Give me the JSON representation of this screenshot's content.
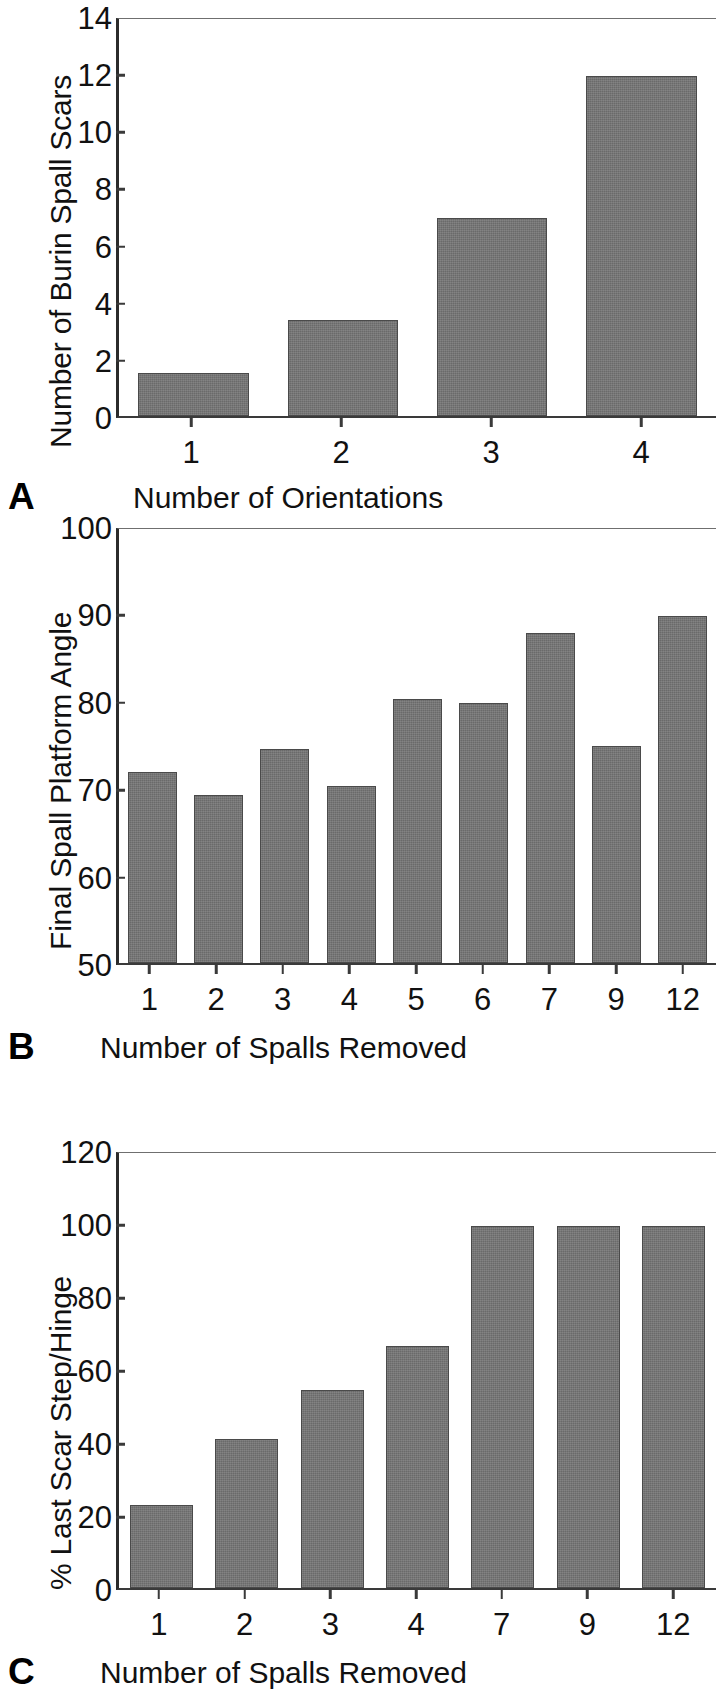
{
  "figure": {
    "background": "#ffffff",
    "bar_color": "#757575",
    "bar_edge_color": "#4a4a4a",
    "axis_color": "#3a3a3a"
  },
  "panels": [
    {
      "label": "A",
      "ylabel": "Number of Burin Spall Scars",
      "xlabel": "Number of Orientations",
      "yticks": [
        "14",
        "12",
        "10",
        "8",
        "6",
        "4",
        "2",
        "0"
      ],
      "xticks": [
        "1",
        "2",
        "3",
        "4"
      ]
    },
    {
      "label": "B",
      "ylabel": "Final Spall Platform Angle",
      "xlabel": "Number of Spalls Removed",
      "yticks": [
        "100",
        "90",
        "80",
        "70",
        "60",
        "50"
      ],
      "xticks": [
        "1",
        "2",
        "3",
        "4",
        "5",
        "6",
        "7",
        "9",
        "12"
      ]
    },
    {
      "label": "C",
      "ylabel": "% Last Scar Step/Hinge",
      "xlabel": "Number of Spalls Removed",
      "yticks": [
        "120",
        "100",
        "80",
        "60",
        "40",
        "20",
        "0"
      ],
      "xticks": [
        "1",
        "2",
        "3",
        "4",
        "7",
        "9",
        "12"
      ]
    }
  ],
  "chart_data": [
    {
      "type": "bar",
      "panel": "A",
      "title": "",
      "xlabel": "Number of Orientations",
      "ylabel": "Number of Burin Spall Scars",
      "categories": [
        "1",
        "2",
        "3",
        "4"
      ],
      "values": [
        1.5,
        3.4,
        7.0,
        12.0
      ],
      "ylim": [
        0,
        14
      ],
      "ytick_step": 2,
      "grid": false,
      "legend": "none"
    },
    {
      "type": "bar",
      "panel": "B",
      "title": "",
      "xlabel": "Number of Spalls Removed",
      "ylabel": "Final Spall Platform Angle",
      "categories": [
        "1",
        "2",
        "3",
        "4",
        "5",
        "6",
        "7",
        "9",
        "12"
      ],
      "values": [
        72.0,
        69.4,
        74.6,
        70.4,
        80.4,
        80.0,
        88.0,
        75.0,
        90.0
      ],
      "ylim": [
        50,
        100
      ],
      "ytick_step": 10,
      "grid": false,
      "legend": "none"
    },
    {
      "type": "bar",
      "panel": "C",
      "title": "",
      "xlabel": "Number of Spalls Removed",
      "ylabel": "% Last Scar Step/Hinge",
      "categories": [
        "1",
        "2",
        "3",
        "4",
        "7",
        "9",
        "12"
      ],
      "values": [
        23.0,
        41.0,
        54.5,
        66.7,
        100.0,
        100.0,
        100.0
      ],
      "ylim": [
        0,
        120
      ],
      "ytick_step": 20,
      "grid": false,
      "legend": "none"
    }
  ]
}
